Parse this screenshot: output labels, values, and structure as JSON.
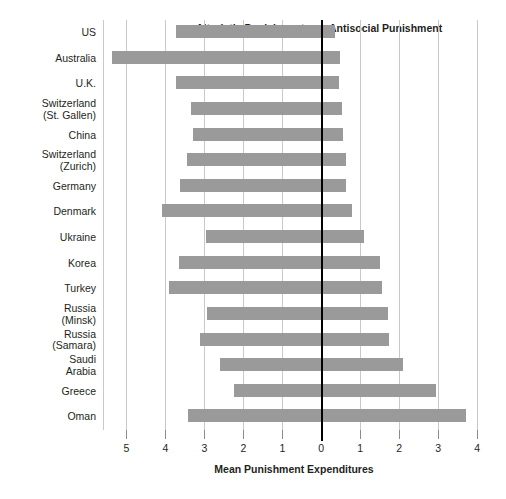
{
  "chart_data": {
    "type": "bar",
    "orientation": "horizontal-diverging",
    "title": "",
    "xlabel": "Mean Punishment Expenditures",
    "ylabel": "",
    "grid": true,
    "legend_position": "none",
    "bar_color": "#9a9a9a",
    "axis_color": "#000000",
    "gridline_color": "#c9c9c9",
    "x_tick_labels": [
      "5",
      "4",
      "3",
      "2",
      "1",
      "0",
      "1",
      "2",
      "3",
      "4"
    ],
    "x_tick_values": [
      -5,
      -4,
      -3,
      -2,
      -1,
      0,
      1,
      2,
      3,
      4
    ],
    "xlim": [
      -5.6,
      4.2
    ],
    "section_headers": {
      "left": "Altruistic Punishment",
      "right": "Antisocial Punishment"
    },
    "categories": [
      "US",
      "Australia",
      "U.K.",
      "Switzerland\n(St. Gallen)",
      "China",
      "Switzerland\n(Zurich)",
      "Germany",
      "Denmark",
      "Ukraine",
      "Korea",
      "Turkey",
      "Russia\n(Minsk)",
      "Russia\n(Samara)",
      "Saudi\nArabia",
      "Greece",
      "Oman"
    ],
    "series": [
      {
        "name": "Altruistic Punishment",
        "values": [
          3.73,
          5.37,
          3.74,
          3.34,
          3.28,
          3.45,
          3.63,
          4.09,
          2.95,
          3.65,
          3.9,
          2.93,
          3.1,
          2.59,
          2.25,
          3.43
        ]
      },
      {
        "name": "Antisocial Punishment",
        "values": [
          0.35,
          0.47,
          0.45,
          0.53,
          0.55,
          0.63,
          0.63,
          0.8,
          1.1,
          1.5,
          1.55,
          1.7,
          1.75,
          2.1,
          2.95,
          3.7
        ]
      }
    ]
  }
}
